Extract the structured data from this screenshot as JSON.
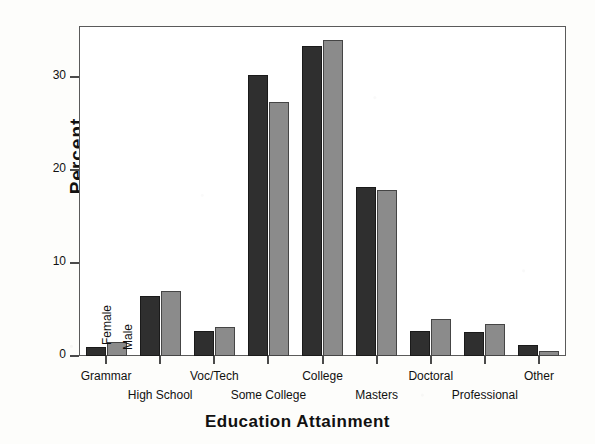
{
  "chart_data": {
    "type": "bar",
    "title": "",
    "xlabel": "Education Attainment",
    "ylabel": "Percent",
    "categories": [
      "Grammar",
      "High School",
      "Voc/Tech",
      "Some College",
      "College",
      "Masters",
      "Doctoral",
      "Professional",
      "Other"
    ],
    "series": [
      {
        "name": "Female",
        "color": "#2f2f2f",
        "values": [
          1.0,
          6.5,
          2.7,
          30.2,
          33.3,
          18.2,
          2.7,
          2.6,
          1.2
        ]
      },
      {
        "name": "Male",
        "color": "#8b8b8b",
        "values": [
          1.5,
          7.0,
          3.1,
          27.3,
          34.0,
          17.9,
          4.0,
          3.4,
          0.5
        ]
      }
    ],
    "ylim": [
      0,
      35.5
    ],
    "yticks": [
      0,
      10,
      20,
      30
    ],
    "ytick_labels": [
      "0",
      "10",
      "20",
      "30"
    ],
    "grid": false,
    "legend_position": "inside-plot-left-rotated"
  },
  "axes": {
    "y_title": "Percent",
    "x_title": "Education Attainment",
    "y_tick_labels": [
      "30",
      "20",
      "10",
      "0"
    ]
  },
  "legend": {
    "female_label": "Female",
    "male_label": "Male"
  }
}
